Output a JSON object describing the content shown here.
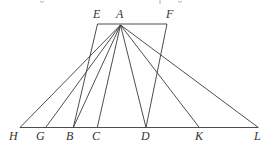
{
  "figure": {
    "colors": {
      "line": "#3a3a3a",
      "label": "#333333",
      "background": "#ffffff"
    },
    "points": {
      "A": {
        "x": 120.5,
        "y": 25
      },
      "E": {
        "x": 97.5,
        "y": 24
      },
      "F": {
        "x": 167,
        "y": 24
      },
      "H": {
        "x": 20,
        "y": 127.5
      },
      "G": {
        "x": 45.7,
        "y": 127.5
      },
      "B": {
        "x": 73.3,
        "y": 127.5
      },
      "C": {
        "x": 97.3,
        "y": 127.5
      },
      "D": {
        "x": 146,
        "y": 127.5
      },
      "K": {
        "x": 199.3,
        "y": 127.5
      },
      "L": {
        "x": 258.3,
        "y": 127.5
      }
    },
    "labels": [
      {
        "id": "E",
        "text": "E",
        "x": 93,
        "y": 18
      },
      {
        "id": "A",
        "text": "A",
        "x": 116,
        "y": 18
      },
      {
        "id": "F",
        "text": "F",
        "x": 166,
        "y": 18
      },
      {
        "id": "H",
        "text": "H",
        "x": 9,
        "y": 140
      },
      {
        "id": "G",
        "text": "G",
        "x": 36,
        "y": 140
      },
      {
        "id": "B",
        "text": "B",
        "x": 66,
        "y": 140
      },
      {
        "id": "C",
        "text": "C",
        "x": 92,
        "y": 140
      },
      {
        "id": "D",
        "text": "D",
        "x": 141,
        "y": 140
      },
      {
        "id": "K",
        "text": "K",
        "x": 195,
        "y": 140
      },
      {
        "id": "L",
        "text": "L",
        "x": 254,
        "y": 140
      }
    ],
    "segments": [
      [
        "E",
        "F"
      ],
      [
        "E",
        "B"
      ],
      [
        "F",
        "D"
      ],
      [
        "H",
        "L"
      ],
      [
        "A",
        "H"
      ],
      [
        "A",
        "G"
      ],
      [
        "A",
        "B"
      ],
      [
        "A",
        "C"
      ],
      [
        "A",
        "D"
      ],
      [
        "A",
        "K"
      ],
      [
        "A",
        "L"
      ]
    ]
  }
}
